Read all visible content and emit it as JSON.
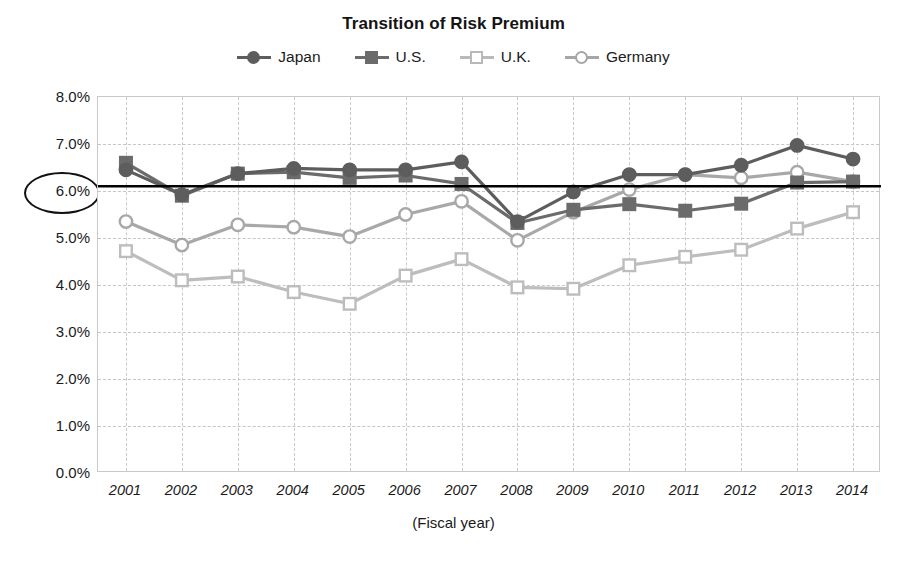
{
  "chart_title": "Transition of Risk Premium",
  "legend": {
    "position": "top-center",
    "items": [
      {
        "label": "Japan",
        "marker": "filled-circle",
        "color": "#5d5d5d"
      },
      {
        "label": "U.S.",
        "marker": "filled-square",
        "color": "#6b6b6b"
      },
      {
        "label": "U.K.",
        "marker": "open-square",
        "color": "#b9b9b9"
      },
      {
        "label": "Germany",
        "marker": "open-circle",
        "color": "#a6a6a6"
      }
    ]
  },
  "axes": {
    "xlabel": "(Fiscal year)",
    "ylabel": "",
    "ytick_labels": [
      "8.0%",
      "7.0%",
      "6.0%",
      "5.0%",
      "4.0%",
      "3.0%",
      "2.0%",
      "1.0%",
      "0.0%"
    ],
    "highlighted_ytick": "6.0%",
    "xtick_labels": [
      "2001",
      "2002",
      "2003",
      "2004",
      "2005",
      "2006",
      "2007",
      "2008",
      "2009",
      "2010",
      "2011",
      "2012",
      "2013",
      "2014"
    ]
  },
  "annotations": {
    "reference_line_label": "6.1%",
    "reference_line_value": 6.1,
    "highlight_ellipse_target": "6.0%"
  },
  "chart_data": {
    "type": "line",
    "title": "Transition of Risk Premium",
    "xlabel": "(Fiscal year)",
    "ylabel": "",
    "ylim": [
      0.0,
      8.0
    ],
    "ytick_step": 1.0,
    "grid": true,
    "legend_position": "top-center",
    "x": [
      "2001",
      "2002",
      "2003",
      "2004",
      "2005",
      "2006",
      "2007",
      "2008",
      "2009",
      "2010",
      "2011",
      "2012",
      "2013",
      "2014"
    ],
    "series": [
      {
        "name": "Japan",
        "marker": "filled-circle",
        "color": "#5d5d5d",
        "values": [
          6.45,
          5.92,
          6.37,
          6.48,
          6.45,
          6.45,
          6.62,
          5.35,
          5.98,
          6.35,
          6.35,
          6.55,
          6.97,
          6.68
        ]
      },
      {
        "name": "U.S.",
        "marker": "filled-square",
        "color": "#6b6b6b",
        "values": [
          6.6,
          5.9,
          6.37,
          6.4,
          6.28,
          6.33,
          6.15,
          5.32,
          5.6,
          5.72,
          5.58,
          5.73,
          6.18,
          6.2
        ]
      },
      {
        "name": "U.K.",
        "marker": "open-square",
        "color": "#bdbdbd",
        "values": [
          4.72,
          4.1,
          4.18,
          3.85,
          3.6,
          4.2,
          4.55,
          3.95,
          3.92,
          4.42,
          4.6,
          4.75,
          5.2,
          5.55
        ]
      },
      {
        "name": "Germany",
        "marker": "open-circle",
        "color": "#a8a8a8",
        "values": [
          5.35,
          4.85,
          5.28,
          5.23,
          5.03,
          5.5,
          5.78,
          4.95,
          5.55,
          6.03,
          6.35,
          6.28,
          6.4,
          6.2
        ]
      }
    ],
    "reference_lines": [
      {
        "value": 6.1,
        "orientation": "horizontal",
        "color": "#000000",
        "style": "solid"
      }
    ]
  }
}
